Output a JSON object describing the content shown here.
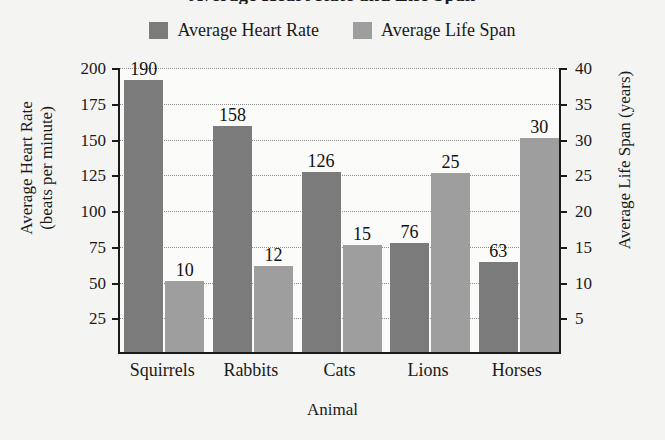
{
  "chart_data": {
    "type": "bar",
    "title": "Average Heart Rate and Life Span",
    "xlabel": "Animal",
    "categories": [
      "Squirrels",
      "Rabbits",
      "Cats",
      "Lions",
      "Horses"
    ],
    "series": [
      {
        "name": "Average Heart Rate",
        "axis": "left",
        "color": "#7b7b7b",
        "values": [
          190,
          158,
          126,
          76,
          63
        ]
      },
      {
        "name": "Average Life Span",
        "axis": "right",
        "color": "#9e9e9e",
        "values": [
          10,
          12,
          15,
          25,
          30
        ]
      }
    ],
    "left_axis": {
      "label_line1": "Average Heart Rate",
      "label_line2": "(beats per minute)",
      "ticks": [
        25,
        50,
        75,
        100,
        125,
        150,
        175,
        200
      ],
      "ylim": [
        0,
        200
      ]
    },
    "right_axis": {
      "label": "Average Life Span (years)",
      "ticks": [
        5,
        10,
        15,
        20,
        25,
        30,
        35,
        40
      ],
      "ylim": [
        0,
        40
      ]
    },
    "grid": true,
    "legend_position": "top"
  },
  "legend": {
    "items": [
      {
        "label": "Average Heart Rate",
        "color": "#7b7b7b"
      },
      {
        "label": "Average Life Span",
        "color": "#9e9e9e"
      }
    ]
  },
  "bar_labels": {
    "heart_rate": [
      "190",
      "158",
      "126",
      "76",
      "63"
    ],
    "life_span": [
      "10",
      "12",
      "15",
      "25",
      "30"
    ]
  },
  "axis_tick_labels": {
    "left": [
      "200",
      "175",
      "150",
      "125",
      "100",
      "75",
      "50",
      "25"
    ],
    "right": [
      "40",
      "35",
      "30",
      "25",
      "20",
      "15",
      "10",
      "5"
    ]
  }
}
